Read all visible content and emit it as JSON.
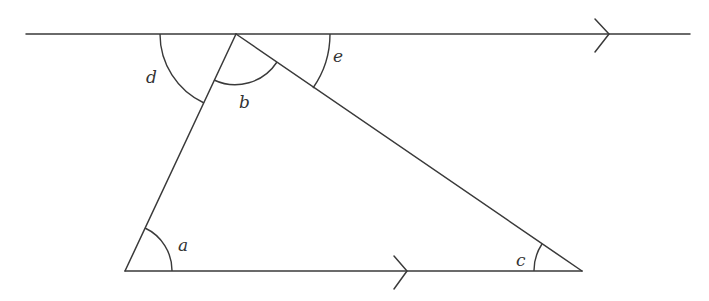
{
  "diagram": {
    "type": "geometry-parallel-lines-triangle",
    "stroke_color": "#3a3a3a",
    "background": "#ffffff",
    "points": {
      "apex": [
        236,
        34
      ],
      "bottom_left": [
        125,
        271
      ],
      "bottom_right": [
        582,
        271
      ]
    },
    "top_line": {
      "x1": 26,
      "y1": 34,
      "x2": 690,
      "y2": 34,
      "arrow_tip": [
        609,
        34
      ],
      "parallel_marker": true
    },
    "bottom_line": {
      "x1": 125,
      "y1": 271,
      "x2": 582,
      "y2": 271,
      "arrow_tip": [
        407,
        271
      ],
      "parallel_marker": true
    },
    "angles": [
      {
        "label": "a",
        "vertex": "bottom_left",
        "label_pos": [
          178,
          251
        ]
      },
      {
        "label": "b",
        "vertex": "apex",
        "label_pos": [
          239,
          108
        ]
      },
      {
        "label": "c",
        "vertex": "bottom_right",
        "label_pos": [
          516,
          266
        ]
      },
      {
        "label": "d",
        "vertex": "apex",
        "label_pos": [
          146,
          83
        ]
      },
      {
        "label": "e",
        "vertex": "apex",
        "label_pos": [
          333,
          62
        ]
      }
    ]
  },
  "labels": {
    "a": "a",
    "b": "b",
    "c": "c",
    "d": "d",
    "e": "e"
  }
}
